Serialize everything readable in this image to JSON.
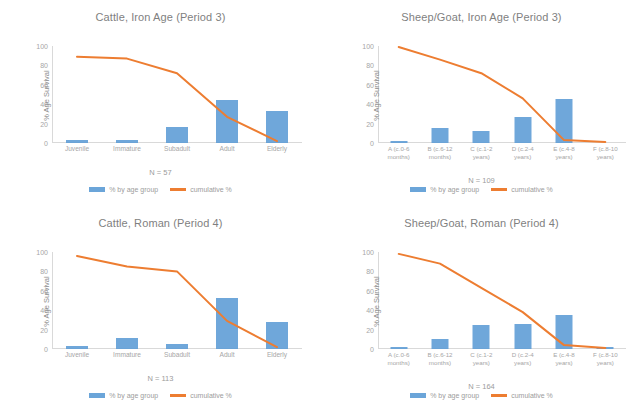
{
  "figure": {
    "ylabel": "% Age Survival",
    "legend": {
      "bar_label": "% by age group",
      "line_label": "cumulative %"
    },
    "colors": {
      "bar": "#5B9BD5",
      "line": "#ED7D31",
      "axis": "#D9D9D9",
      "text": "#808080"
    },
    "yticks": [
      "0",
      "20",
      "40",
      "60",
      "80",
      "100"
    ]
  },
  "chart_data": [
    {
      "type": "bar",
      "id": "cattle-iron-age",
      "title": "Cattle, Iron Age (Period 3)",
      "n_label": "N = 57",
      "categories": [
        "Juvenile",
        "Immature",
        "Subadult",
        "Adult",
        "Elderly"
      ],
      "series": [
        {
          "name": "% by age group",
          "values": [
            3,
            3,
            16,
            44,
            33
          ]
        },
        {
          "name": "cumulative %",
          "values": [
            89,
            87,
            72,
            27,
            2
          ]
        }
      ],
      "xlabel": "",
      "ylabel": "% Age Survival",
      "ylim": [
        0,
        100
      ],
      "grid": false,
      "legend_position": "bottom"
    },
    {
      "type": "bar",
      "id": "sheep-goat-iron-age",
      "title": "Sheep/Goat, Iron Age (Period 3)",
      "n_label": "N = 109",
      "categories": [
        "A (c.0-6 months)",
        "B (c.6-12 months)",
        "C (c.1-2 years)",
        "D (c.2-4 years)",
        "E (c.4-8 years)",
        "F (c.8-10 years)"
      ],
      "series": [
        {
          "name": "% by age group",
          "values": [
            1,
            15,
            12,
            27,
            45,
            0
          ]
        },
        {
          "name": "cumulative %",
          "values": [
            99,
            86,
            72,
            46,
            3,
            1
          ]
        }
      ],
      "xlabel": "",
      "ylabel": "% Age Survival",
      "ylim": [
        0,
        100
      ],
      "grid": false,
      "legend_position": "bottom"
    },
    {
      "type": "bar",
      "id": "cattle-roman",
      "title": "Cattle, Roman (Period 4)",
      "n_label": "N = 113",
      "categories": [
        "Juvenile",
        "Immature",
        "Subadult",
        "Adult",
        "Elderly"
      ],
      "series": [
        {
          "name": "% by age group",
          "values": [
            3,
            11,
            5,
            53,
            28
          ]
        },
        {
          "name": "cumulative %",
          "values": [
            96,
            85,
            80,
            29,
            2
          ]
        }
      ],
      "xlabel": "",
      "ylabel": "% Age Survival",
      "ylim": [
        0,
        100
      ],
      "grid": false,
      "legend_position": "bottom"
    },
    {
      "type": "bar",
      "id": "sheep-goat-roman",
      "title": "Sheep/Goat, Roman (Period 4)",
      "n_label": "N = 164",
      "categories": [
        "A (c.0-6 months)",
        "B (c.6-12 months)",
        "C (c.1-2 years)",
        "D (c.2-4 years)",
        "E (c.4-8 years)",
        "F (c.8-10 years)"
      ],
      "series": [
        {
          "name": "% by age group",
          "values": [
            1,
            10,
            25,
            26,
            35,
            1
          ]
        },
        {
          "name": "cumulative %",
          "values": [
            98,
            88,
            63,
            38,
            4,
            1
          ]
        }
      ],
      "xlabel": "",
      "ylabel": "% Age Survival",
      "ylim": [
        0,
        100
      ],
      "grid": false,
      "legend_position": "bottom"
    }
  ]
}
